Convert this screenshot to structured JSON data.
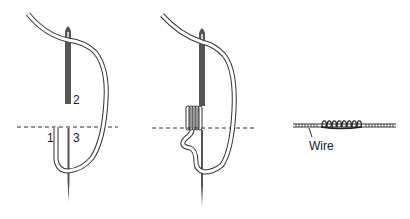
{
  "figure": {
    "panel1": {
      "labels": {
        "step1": "1",
        "step2": "2",
        "step3": "3"
      }
    },
    "panel2": {},
    "panel3": {
      "wire_label": "Wire"
    }
  },
  "colors": {
    "needle": "#555555",
    "thread_outline": "#333333",
    "dashed_line": "#333333",
    "background": "#ffffff"
  }
}
